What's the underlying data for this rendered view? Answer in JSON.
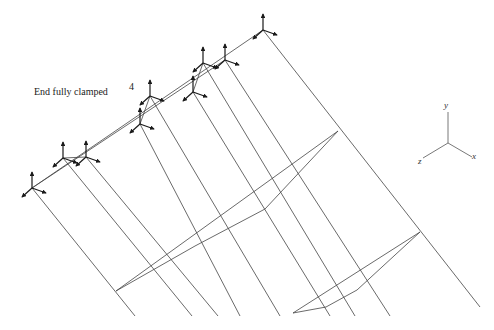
{
  "diagram": {
    "annotations": {
      "end_condition": "End fully clamped",
      "node_number": "4"
    },
    "axes": {
      "x": "x",
      "y": "y",
      "z": "z"
    },
    "colors": {
      "line": "#444444",
      "arrow": "#1a1a1a",
      "background": "#ffffff"
    },
    "top_nodes": [
      [
        32,
        188
      ],
      [
        63,
        158
      ],
      [
        86,
        157
      ],
      [
        140,
        124
      ],
      [
        150,
        96
      ],
      [
        193,
        92
      ],
      [
        203,
        63
      ],
      [
        225,
        60
      ],
      [
        263,
        30
      ]
    ],
    "cables": [
      [
        [
          32,
          188
        ],
        [
          135,
          316
        ]
      ],
      [
        [
          63,
          158
        ],
        [
          192,
          316
        ]
      ],
      [
        [
          86,
          157
        ],
        [
          218,
          316
        ]
      ],
      [
        [
          140,
          124
        ],
        [
          240,
          316
        ]
      ],
      [
        [
          150,
          96
        ],
        [
          280,
          316
        ]
      ],
      [
        [
          193,
          92
        ],
        [
          330,
          316
        ]
      ],
      [
        [
          203,
          63
        ],
        [
          355,
          316
        ]
      ],
      [
        [
          225,
          60
        ],
        [
          390,
          316
        ]
      ],
      [
        [
          263,
          30
        ],
        [
          480,
          307
        ]
      ]
    ]
  }
}
